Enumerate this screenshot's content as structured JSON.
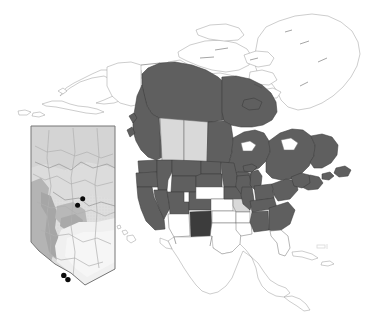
{
  "figure": {
    "kind": "distribution-map",
    "title": "",
    "caption": "",
    "background_color": "#ffffff",
    "width": 369,
    "height": 313
  },
  "palette": {
    "dark_gray_fill": "#5f5f5f",
    "darkest_fill": "#3c3c3c",
    "light_gray_fill": "#d9d9d9",
    "white_fill": "#ffffff",
    "outline": "#3b3b3b",
    "thin_outline": "#8a8a8a",
    "dot_color": "#0b0b0b",
    "inset_relief_light": "#dcdcdc",
    "inset_relief_mid": "#c3c3c3",
    "inset_relief_dark": "#a8a8a8",
    "inset_plain": "#ededed"
  },
  "legend": {
    "present": false,
    "entries": []
  },
  "main_map": {
    "name": "north-america-map",
    "projection_note": "",
    "regions": [
      {
        "id": "greenland",
        "label": "Greenland",
        "shading": "white"
      },
      {
        "id": "canada-arctic-islands",
        "label": "Arctic Islands",
        "shading": "white"
      },
      {
        "id": "alaska",
        "label": "Alaska",
        "shading": "white"
      },
      {
        "id": "yukon",
        "label": "Yukon",
        "shading": "white"
      },
      {
        "id": "northwest-territories",
        "label": "Northwest Territories",
        "shading": "dark"
      },
      {
        "id": "nunavut",
        "label": "Nunavut",
        "shading": "dark"
      },
      {
        "id": "british-columbia",
        "label": "British Columbia",
        "shading": "dark"
      },
      {
        "id": "alberta",
        "label": "Alberta",
        "shading": "light"
      },
      {
        "id": "saskatchewan",
        "label": "Saskatchewan",
        "shading": "light"
      },
      {
        "id": "manitoba",
        "label": "Manitoba",
        "shading": "dark"
      },
      {
        "id": "ontario",
        "label": "Ontario",
        "shading": "dark"
      },
      {
        "id": "quebec",
        "label": "Quebec",
        "shading": "dark"
      },
      {
        "id": "labrador-newfoundland",
        "label": "Newfoundland and Labrador",
        "shading": "dark"
      },
      {
        "id": "maritimes",
        "label": "Maritime provinces",
        "shading": "dark"
      },
      {
        "id": "washington",
        "label": "Washington",
        "shading": "dark"
      },
      {
        "id": "oregon",
        "label": "Oregon",
        "shading": "dark"
      },
      {
        "id": "california",
        "label": "California",
        "shading": "dark"
      },
      {
        "id": "idaho",
        "label": "Idaho",
        "shading": "dark"
      },
      {
        "id": "nevada",
        "label": "Nevada",
        "shading": "dark"
      },
      {
        "id": "montana",
        "label": "Montana",
        "shading": "dark"
      },
      {
        "id": "wyoming",
        "label": "Wyoming",
        "shading": "dark"
      },
      {
        "id": "utah",
        "label": "Utah",
        "shading": "dark"
      },
      {
        "id": "colorado",
        "label": "Colorado",
        "shading": "dark"
      },
      {
        "id": "arizona",
        "label": "Arizona",
        "shading": "white"
      },
      {
        "id": "new-mexico",
        "label": "New Mexico",
        "shading": "darkest"
      },
      {
        "id": "north-dakota",
        "label": "North Dakota",
        "shading": "dark"
      },
      {
        "id": "south-dakota",
        "label": "South Dakota",
        "shading": "dark"
      },
      {
        "id": "nebraska",
        "label": "Nebraska",
        "shading": "white"
      },
      {
        "id": "kansas",
        "label": "Kansas",
        "shading": "white"
      },
      {
        "id": "oklahoma",
        "label": "Oklahoma",
        "shading": "white"
      },
      {
        "id": "texas",
        "label": "Texas",
        "shading": "white"
      },
      {
        "id": "minnesota",
        "label": "Minnesota",
        "shading": "dark"
      },
      {
        "id": "iowa",
        "label": "Iowa",
        "shading": "dark"
      },
      {
        "id": "missouri",
        "label": "Missouri",
        "shading": "light"
      },
      {
        "id": "arkansas",
        "label": "Arkansas",
        "shading": "white"
      },
      {
        "id": "louisiana",
        "label": "Louisiana",
        "shading": "white"
      },
      {
        "id": "wisconsin",
        "label": "Wisconsin",
        "shading": "dark"
      },
      {
        "id": "illinois",
        "label": "Illinois",
        "shading": "dark"
      },
      {
        "id": "michigan",
        "label": "Michigan",
        "shading": "dark"
      },
      {
        "id": "indiana-ohio",
        "label": "Indiana and Ohio",
        "shading": "dark"
      },
      {
        "id": "kentucky-tennessee",
        "label": "Kentucky and Tennessee",
        "shading": "dark"
      },
      {
        "id": "mississippi-alabama",
        "label": "Mississippi and Alabama",
        "shading": "dark"
      },
      {
        "id": "georgia-carolinas",
        "label": "Georgia and the Carolinas",
        "shading": "dark"
      },
      {
        "id": "florida",
        "label": "Florida",
        "shading": "white"
      },
      {
        "id": "mid-atlantic",
        "label": "Mid-Atlantic states",
        "shading": "dark"
      },
      {
        "id": "new-england",
        "label": "New England",
        "shading": "dark"
      },
      {
        "id": "mexico",
        "label": "Mexico",
        "shading": "white"
      },
      {
        "id": "central-america",
        "label": "Central America",
        "shading": "white"
      },
      {
        "id": "cuba-caribbean",
        "label": "Caribbean islands",
        "shading": "white"
      },
      {
        "id": "hawaii",
        "label": "Hawaii",
        "shading": "white"
      }
    ]
  },
  "inset_map": {
    "name": "alberta-inset-map",
    "label": "Alberta",
    "border": true,
    "occurrence_points": [
      {
        "id": "point-1",
        "x_pct": 60.5,
        "y_pct": 46.5
      },
      {
        "id": "point-2",
        "x_pct": 55.0,
        "y_pct": 50.5
      },
      {
        "id": "point-3",
        "x_pct": 40.0,
        "y_pct": 93.0
      },
      {
        "id": "point-4",
        "x_pct": 44.5,
        "y_pct": 95.5
      }
    ],
    "point_count": 4
  },
  "annotations": {
    "scanner_artifact": {
      "name": "scan-artifact",
      "visible": true,
      "text": ""
    }
  }
}
